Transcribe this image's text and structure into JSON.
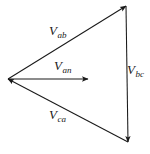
{
  "figure": {
    "type": "phasor-diagram",
    "background_color": "#ffffff",
    "line_color": "#1a1a1a",
    "width": 150,
    "height": 154,
    "vertices": {
      "left": {
        "x": 8,
        "y": 79
      },
      "top_right": {
        "x": 126,
        "y": 6
      },
      "bottom_right": {
        "x": 128,
        "y": 142
      }
    },
    "vectors": [
      {
        "id": "vab",
        "symbol": "V",
        "subscript": "ab",
        "label": "Vab",
        "from": {
          "x": 8,
          "y": 79
        },
        "to": {
          "x": 126,
          "y": 6
        },
        "arrowhead_at": "to"
      },
      {
        "id": "van",
        "symbol": "V",
        "subscript": "an",
        "label": "Van",
        "from": {
          "x": 8,
          "y": 79
        },
        "to": {
          "x": 88,
          "y": 79
        },
        "arrowhead_at": "to"
      },
      {
        "id": "vca",
        "symbol": "V",
        "subscript": "ca",
        "label": "Vca",
        "from": {
          "x": 128,
          "y": 142
        },
        "to": {
          "x": 8,
          "y": 79
        },
        "arrowhead_at": "to"
      },
      {
        "id": "vbc",
        "symbol": "V",
        "subscript": "bc",
        "label": "Vbc",
        "from": {
          "x": 126,
          "y": 6
        },
        "to": {
          "x": 128,
          "y": 142
        },
        "arrowhead_at": "to"
      }
    ]
  }
}
